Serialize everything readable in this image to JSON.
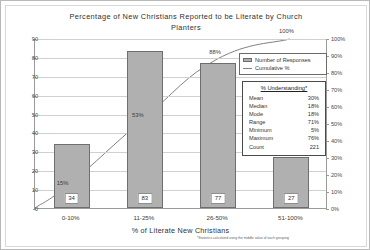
{
  "chart_data": {
    "type": "bar",
    "title": "Percentage of New Christians Reported to be Literate by Church Planters",
    "title_line1": "Percentage of New Christians Reported to be Literate by Church",
    "title_line2": "Planters",
    "xlabel": "% of Literate New Christians",
    "ylabel": "",
    "categories": [
      "0-10%",
      "11-25%",
      "26-50%",
      "51-100%"
    ],
    "series": [
      {
        "name": "Number of Responses",
        "type": "bar",
        "values": [
          34,
          83,
          77,
          27
        ],
        "axis": "left"
      },
      {
        "name": "Cumulative %",
        "type": "line",
        "values": [
          15,
          53,
          88,
          100
        ],
        "labels": [
          "15%",
          "53%",
          "88%",
          "100%"
        ],
        "axis": "right"
      }
    ],
    "ylim": [
      0,
      90
    ],
    "ylim_right": [
      0,
      100
    ],
    "yticks": [
      "0",
      "10",
      "20",
      "30",
      "40",
      "50",
      "60",
      "70",
      "80",
      "90"
    ],
    "yticks_right": [
      "0%",
      "10%",
      "20%",
      "30%",
      "40%",
      "50%",
      "60%",
      "70%",
      "80%",
      "90%",
      "100%"
    ],
    "grid": true,
    "legend_position": "upper-right",
    "footnote": "*Statistics calculated using the middle value of each grouping",
    "colors": {
      "bar_fill": "#b0b0b0",
      "bar_border": "#6e6e6e",
      "line": "#808080",
      "grid": "#d0d0d0",
      "axis": "#9a9a9a"
    }
  },
  "legend": {
    "items": [
      {
        "label": "Number of Responses",
        "marker": "bar-swatch"
      },
      {
        "label": "Cumulative %",
        "marker": "line-swatch"
      }
    ]
  },
  "stats_box": {
    "title": "% Understanding*",
    "rows": [
      {
        "label": "Mean",
        "value": "30%"
      },
      {
        "label": "Median",
        "value": "18%"
      },
      {
        "label": "Mode",
        "value": "18%"
      },
      {
        "label": "Range",
        "value": "71%"
      },
      {
        "label": "Minimum",
        "value": "5%"
      },
      {
        "label": "Maximum",
        "value": "76%"
      },
      {
        "label": "Count",
        "value": "221"
      }
    ]
  }
}
